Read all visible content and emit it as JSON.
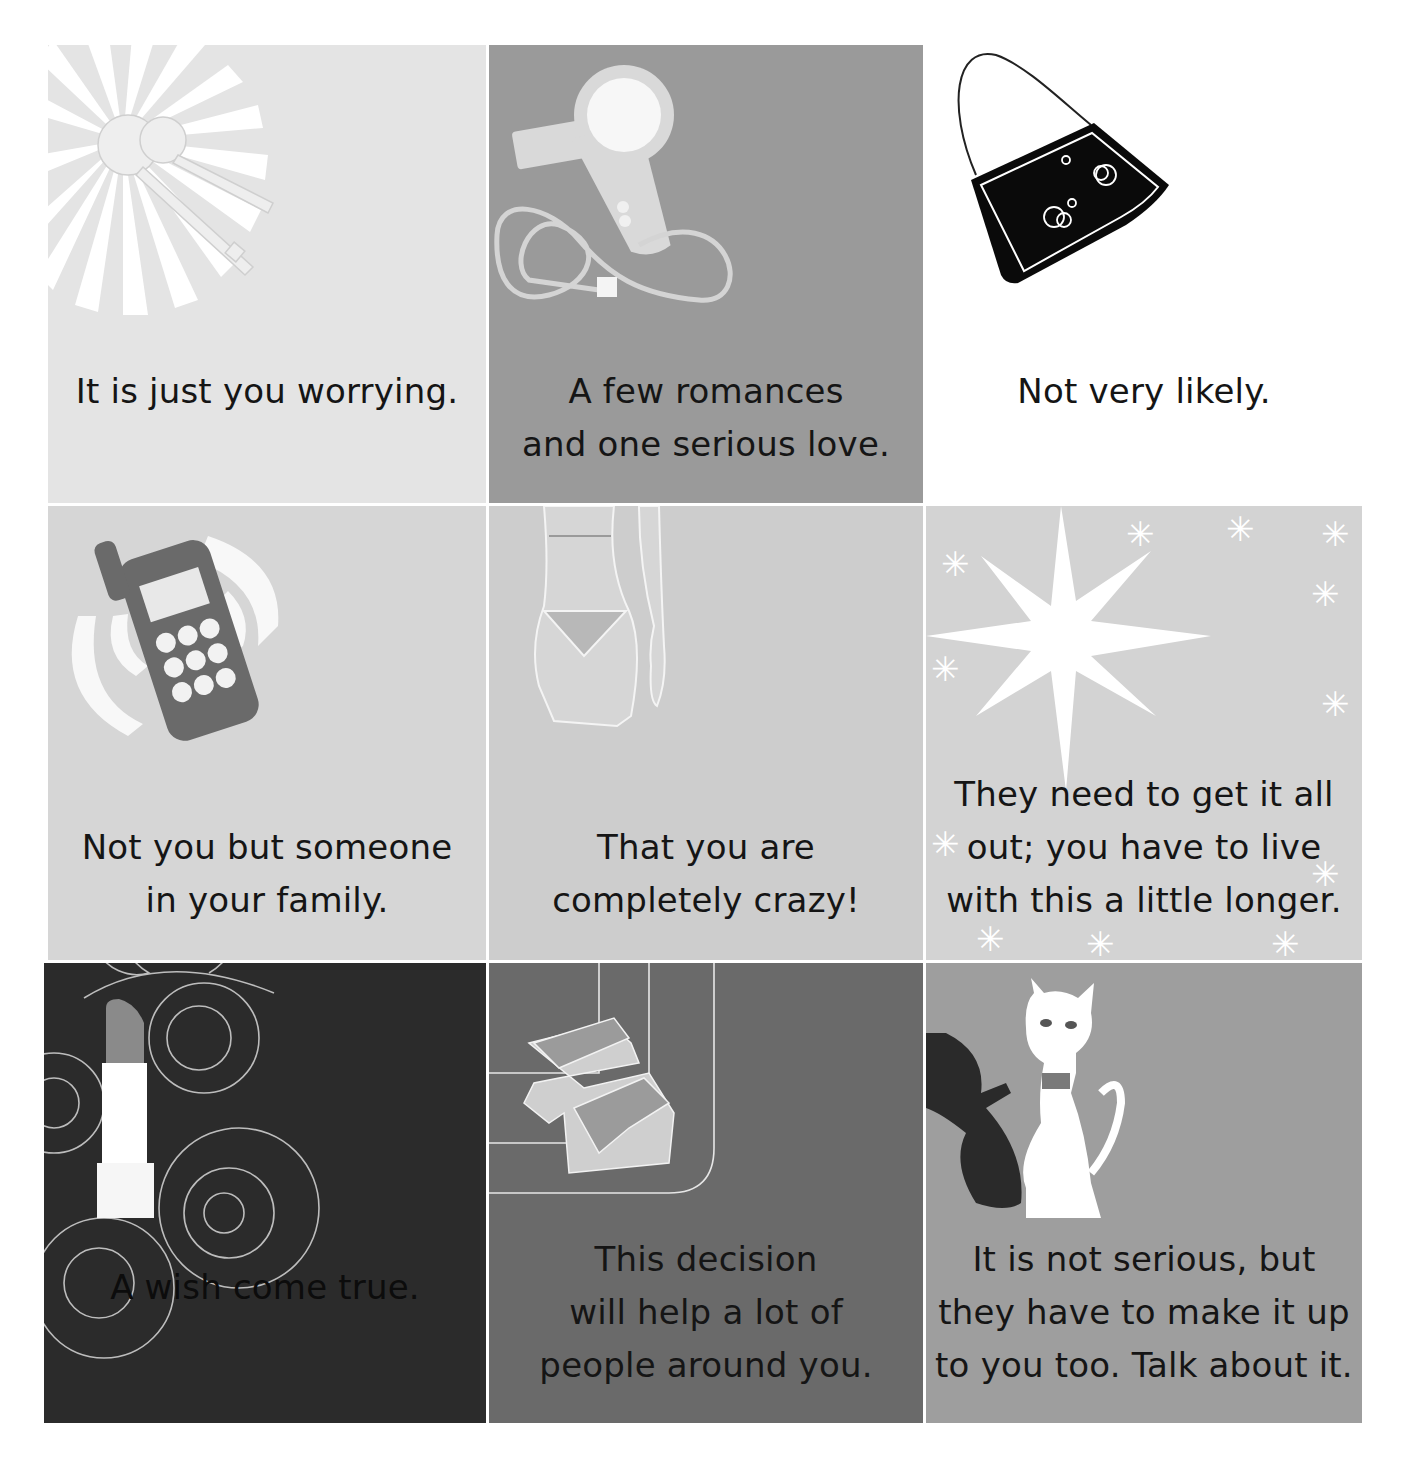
{
  "grid": {
    "rows": 3,
    "cols": 3,
    "tiles": [
      {
        "illustration": "keys-with-sunburst",
        "background": "#e4e4e4",
        "text": "It is just you worrying."
      },
      {
        "illustration": "hair-dryer",
        "background": "#9a9a9a",
        "text": "A few romances\nand one serious love."
      },
      {
        "illustration": "handbag",
        "background": "#ffffff",
        "text": "Not very likely."
      },
      {
        "illustration": "ringing-mobile-phone",
        "background": "#d6d6d6",
        "text": "Not you but someone\nin your family."
      },
      {
        "illustration": "body-in-bikini",
        "background": "#cdcdcd",
        "text": "That you are\ncompletely crazy!"
      },
      {
        "illustration": "big-star-with-sparkles",
        "background": "#d3d3d3",
        "text": "They need to get it all\nout; you have to live\nwith this a little longer."
      },
      {
        "illustration": "lipstick-with-swirls",
        "background": "#2b2b2b",
        "text": "A wish come true."
      },
      {
        "illustration": "platform-sandal",
        "background": "#6a6a6a",
        "text": "This decision\nwill help a lot of\npeople around you."
      },
      {
        "illustration": "white-cat-with-shadow",
        "background": "#9e9e9e",
        "text": "It is not serious, but\nthey have to make it up\nto you too. Talk about it."
      }
    ]
  }
}
